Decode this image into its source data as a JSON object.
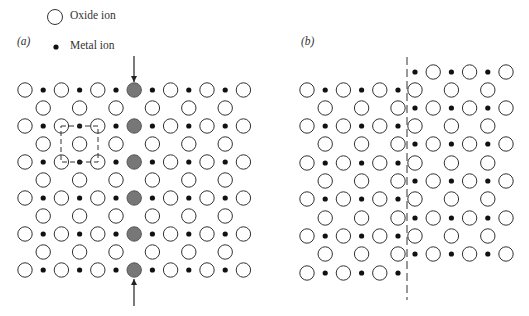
{
  "legend": {
    "oxide_label": "Oxide ion",
    "metal_label": "Metal ion"
  },
  "panels": {
    "a_label": "(a)",
    "b_label": "(b)"
  },
  "style": {
    "circle_stroke": "#333333",
    "dot_fill": "#111111",
    "shaded_fill": "#777777",
    "circle_radius": 7.2,
    "dot_radius": 2.6
  },
  "panel_a": {
    "origin_x": 25,
    "pitch_x": 36.4,
    "full_rows_y": [
      90,
      126,
      162,
      198,
      234,
      270
    ],
    "offset_rows_y": [
      108,
      144,
      180,
      216,
      252
    ],
    "full_row_circles": 7,
    "offset_row_circles": 6,
    "shaded_column_index": 3,
    "dashed_square": {
      "x": 61,
      "y": 126,
      "w": 37,
      "h": 36
    },
    "arrow_top": {
      "x": 134,
      "y1": 56,
      "y2": 82
    },
    "arrow_bottom": {
      "x": 134,
      "y1": 306,
      "y2": 279
    }
  },
  "panel_b": {
    "left": {
      "origin_x": 307,
      "pitch_x": 36.4,
      "full_rows_y": [
        90,
        126,
        163,
        199,
        236,
        273
      ],
      "offset_rows_y": [
        108,
        144,
        181,
        218,
        254
      ],
      "full_row_circles": 3,
      "offset_row_circles": 3
    },
    "right": {
      "origin_x": 415,
      "pitch_x": 36.4,
      "dot_rows_y": [
        72,
        108,
        144,
        181,
        218,
        254
      ],
      "circle_rows_y": [
        90,
        126,
        163,
        199,
        236
      ],
      "dot_row_count": 3,
      "circle_row_count": 3
    },
    "dislocation_line": {
      "x": 407,
      "y1": 57,
      "y2": 300
    }
  }
}
